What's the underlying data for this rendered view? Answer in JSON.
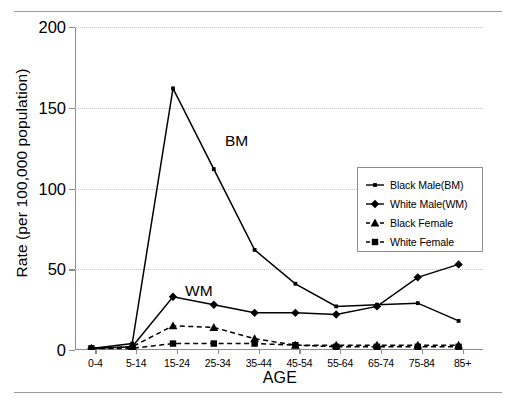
{
  "figure": {
    "rule_top": "horizontal-rule",
    "rule_bottom": "horizontal-rule",
    "caption_fragment": ""
  },
  "chart_data": {
    "type": "line",
    "title": "",
    "xlabel": "AGE",
    "ylabel": "Rate (per 100,000 population)",
    "categories": [
      "0-4",
      "5-14",
      "15-24",
      "25-34",
      "35-44",
      "45-54",
      "55-64",
      "65-74",
      "75-84",
      "85+"
    ],
    "ylim": [
      0,
      200
    ],
    "yticks": [
      0,
      50,
      100,
      150,
      200
    ],
    "grid": "horizontal-dotted",
    "legend_position": "right-middle",
    "series": [
      {
        "name": "Black Male(BM)",
        "key": "black_male",
        "marker": "square-small",
        "linestyle": "solid",
        "color": "#000000",
        "values": [
          1,
          4,
          162,
          112,
          62,
          41,
          27,
          28,
          29,
          18
        ]
      },
      {
        "name": "White Male(WM)",
        "key": "white_male",
        "marker": "diamond",
        "linestyle": "solid",
        "color": "#000000",
        "values": [
          1,
          2,
          33,
          28,
          23,
          23,
          22,
          27,
          45,
          53
        ]
      },
      {
        "name": "Black Female",
        "key": "black_female",
        "marker": "triangle",
        "linestyle": "dashed",
        "color": "#000000",
        "values": [
          1,
          2,
          15,
          14,
          7,
          3,
          3,
          3,
          3,
          3
        ]
      },
      {
        "name": "White Female",
        "key": "white_female",
        "marker": "square",
        "linestyle": "dashed",
        "color": "#000000",
        "values": [
          1,
          1,
          4,
          4,
          4,
          3,
          2,
          2,
          2,
          2
        ]
      }
    ],
    "annotations": [
      {
        "text": "BM",
        "series": "black_male"
      },
      {
        "text": "WM",
        "series": "white_male"
      }
    ]
  }
}
